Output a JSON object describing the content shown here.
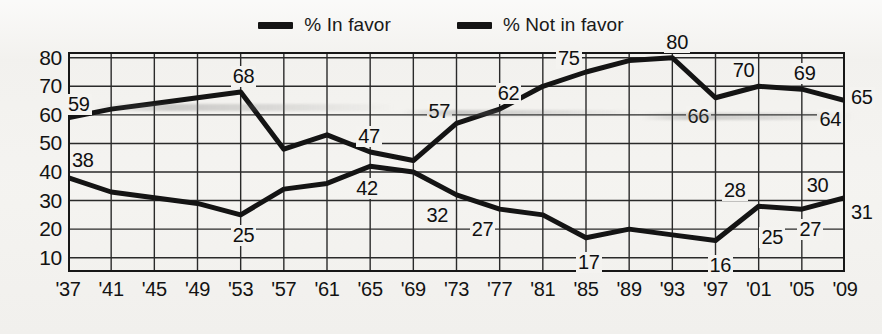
{
  "legend": {
    "position": "top-center",
    "entries": [
      {
        "label": "% In favor",
        "color": "#141414",
        "marker": "thick-line-swatch"
      },
      {
        "label": "% Not in favor",
        "color": "#141414",
        "marker": "thick-line-swatch"
      }
    ]
  },
  "axes": {
    "y_ticks": [
      80,
      70,
      60,
      50,
      40,
      30,
      20,
      10
    ],
    "x_ticks": [
      "'37",
      "'41",
      "'45",
      "'49",
      "'53",
      "'57",
      "'61",
      "'65",
      "'69",
      "'73",
      "'77",
      "'81",
      "'85",
      "'89",
      "'93",
      "'97",
      "'01",
      "'05",
      "'09"
    ]
  },
  "chart_data": {
    "type": "line",
    "title": "",
    "subtitle": "",
    "xlabel": "",
    "ylabel": "",
    "xlim": [
      1937,
      2009
    ],
    "ylim": [
      5,
      82
    ],
    "grid": true,
    "legend_position": "top-center",
    "x": [
      1937,
      1941,
      1945,
      1949,
      1953,
      1957,
      1961,
      1965,
      1969,
      1973,
      1977,
      1981,
      1985,
      1989,
      1993,
      1997,
      2001,
      2005,
      2009
    ],
    "series": [
      {
        "name": "% In favor",
        "color": "#141414",
        "values": [
          59,
          62,
          64,
          66,
          68,
          48,
          53,
          47,
          44,
          57,
          62,
          70,
          75,
          79,
          80,
          66,
          70,
          69,
          65
        ]
      },
      {
        "name": "% Not in favor",
        "color": "#141414",
        "values": [
          38,
          33,
          31,
          29,
          25,
          34,
          36,
          42,
          40,
          32,
          27,
          25,
          17,
          20,
          18,
          16,
          28,
          27,
          31
        ]
      }
    ],
    "annotations": [
      {
        "text": "59",
        "series": "% In favor",
        "x": 1937,
        "y": 59
      },
      {
        "text": "68",
        "series": "% In favor",
        "x": 1953,
        "y": 68
      },
      {
        "text": "47",
        "series": "% In favor",
        "x": 1965,
        "y": 47
      },
      {
        "text": "57",
        "series": "% In favor",
        "x": 1973,
        "y": 57
      },
      {
        "text": "62",
        "series": "% In favor",
        "x": 1977,
        "y": 62
      },
      {
        "text": "75",
        "series": "% In favor",
        "x": 1985,
        "y": 75
      },
      {
        "text": "80",
        "series": "% In favor",
        "x": 1993,
        "y": 80
      },
      {
        "text": "66",
        "series": "% In favor",
        "x": 1997,
        "y": 66
      },
      {
        "text": "70",
        "series": "% In favor",
        "x": 2001,
        "y": 70
      },
      {
        "text": "69",
        "series": "% In favor",
        "x": 2005,
        "y": 69
      },
      {
        "text": "64",
        "series": "% In favor",
        "x": 2007,
        "y": 64
      },
      {
        "text": "65",
        "series": "% In favor",
        "x": 2009,
        "y": 65
      },
      {
        "text": "38",
        "series": "% Not in favor",
        "x": 1937,
        "y": 38
      },
      {
        "text": "25",
        "series": "% Not in favor",
        "x": 1953,
        "y": 25
      },
      {
        "text": "42",
        "series": "% Not in favor",
        "x": 1965,
        "y": 42
      },
      {
        "text": "32",
        "series": "% Not in favor",
        "x": 1973,
        "y": 32
      },
      {
        "text": "27",
        "series": "% Not in favor",
        "x": 1977,
        "y": 27
      },
      {
        "text": "17",
        "series": "% Not in favor",
        "x": 1985,
        "y": 17
      },
      {
        "text": "16",
        "series": "% Not in favor",
        "x": 1997,
        "y": 16
      },
      {
        "text": "28",
        "series": "% Not in favor",
        "x": 2000,
        "y": 28
      },
      {
        "text": "25",
        "series": "% Not in favor",
        "x": 2002,
        "y": 25
      },
      {
        "text": "30",
        "series": "% Not in favor",
        "x": 2006,
        "y": 30
      },
      {
        "text": "27",
        "series": "% Not in favor",
        "x": 2007,
        "y": 27
      },
      {
        "text": "31",
        "series": "% Not in favor",
        "x": 2009,
        "y": 31
      }
    ]
  }
}
